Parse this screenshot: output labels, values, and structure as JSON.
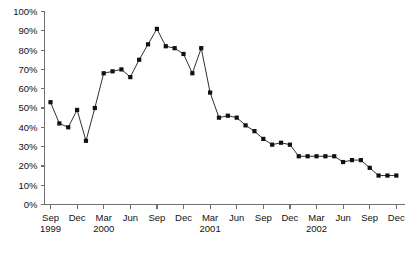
{
  "chart_data": {
    "type": "line",
    "title": "",
    "subtitle": "",
    "xlabel": "",
    "ylabel": "",
    "ylim": [
      0,
      100
    ],
    "ytick_labels": [
      "0%",
      "10%",
      "20%",
      "30%",
      "40%",
      "50%",
      "60%",
      "70%",
      "80%",
      "90%",
      "100%"
    ],
    "ytick_values": [
      0,
      10,
      20,
      30,
      40,
      50,
      60,
      70,
      80,
      90,
      100
    ],
    "grid": false,
    "legend": null,
    "legend_position": "none",
    "marker": "square",
    "line_color": "#1a1a1a",
    "marker_color": "#111111",
    "axis_color": "#6f6f6f",
    "xtick_labels": [
      {
        "month": "Sep",
        "year": "1999"
      },
      {
        "month": "Dec",
        "year": ""
      },
      {
        "month": "Mar",
        "year": "2000"
      },
      {
        "month": "Jun",
        "year": ""
      },
      {
        "month": "Sep",
        "year": ""
      },
      {
        "month": "Dec",
        "year": ""
      },
      {
        "month": "Mar",
        "year": "2001"
      },
      {
        "month": "Jun",
        "year": ""
      },
      {
        "month": "Sep",
        "year": ""
      },
      {
        "month": "Dec",
        "year": ""
      },
      {
        "month": "Mar",
        "year": "2002"
      },
      {
        "month": "Jun",
        "year": ""
      },
      {
        "month": "Sep",
        "year": ""
      },
      {
        "month": "Dec",
        "year": ""
      }
    ],
    "x": [
      "Sep 1999",
      "Oct 1999",
      "Nov 1999",
      "Dec 1999",
      "Jan 2000",
      "Feb 2000",
      "Mar 2000",
      "Apr 2000",
      "May 2000",
      "Jun 2000",
      "Jul 2000",
      "Aug 2000",
      "Sep 2000",
      "Oct 2000",
      "Nov 2000",
      "Dec 2000",
      "Jan 2001",
      "Feb 2001",
      "Mar 2001",
      "Apr 2001",
      "May 2001",
      "Jun 2001",
      "Jul 2001",
      "Aug 2001",
      "Sep 2001",
      "Oct 2001",
      "Nov 2001",
      "Dec 2001",
      "Jan 2002",
      "Feb 2002",
      "Mar 2002",
      "Apr 2002",
      "May 2002",
      "Jun 2002",
      "Jul 2002",
      "Aug 2002",
      "Sep 2002",
      "Oct 2002",
      "Nov 2002",
      "Dec 2002"
    ],
    "values": [
      53,
      42,
      40,
      49,
      33,
      50,
      68,
      69,
      70,
      66,
      75,
      83,
      91,
      82,
      81,
      78,
      68,
      81,
      58,
      45,
      46,
      45,
      41,
      38,
      34,
      31,
      32,
      31,
      25,
      25,
      25,
      25,
      25,
      22,
      23,
      23,
      19,
      15,
      15,
      15
    ],
    "values_unit": "%"
  }
}
